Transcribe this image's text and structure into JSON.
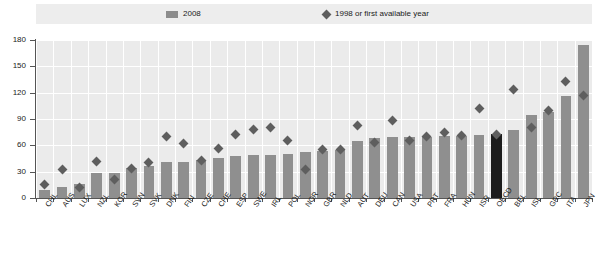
{
  "legend": {
    "items": [
      {
        "label": "2008",
        "marker": "bar-swatch-icon",
        "color": "#8c8c8c"
      },
      {
        "label": "1998 or first available year",
        "marker": "diamond-icon",
        "color": "#5e5e5e"
      }
    ]
  },
  "axis": {
    "y_ticks": [
      "0",
      "30",
      "60",
      "90",
      "120",
      "150",
      "180"
    ]
  },
  "chart_data": {
    "type": "bar",
    "title": "",
    "xlabel": "",
    "ylabel": "",
    "ylim": [
      0,
      180
    ],
    "grid": true,
    "legend_position": "top",
    "highlight_category": "OECD",
    "highlight_color": "#1c1c1c",
    "bar_color": "#8f8f8f",
    "marker_color": "#5e5e5e",
    "categories": [
      "CHL",
      "AUS",
      "LUX",
      "NZL",
      "KOR",
      "SVN",
      "SVK",
      "DNK",
      "FIN",
      "CZE",
      "CHE",
      "ESP",
      "SWE",
      "IRL",
      "POL",
      "NOR",
      "GBR",
      "NLD",
      "AUT",
      "DEU",
      "CAN",
      "USA",
      "PRT",
      "FRA",
      "HUN",
      "ISR",
      "OECD",
      "BEL",
      "ISL",
      "GRC",
      "ITA",
      "JPN"
    ],
    "series": [
      {
        "name": "2008",
        "type": "bar",
        "values": [
          9,
          13,
          16,
          28,
          29,
          34,
          37,
          41,
          41,
          43,
          46,
          48,
          49,
          49,
          50,
          52,
          53,
          55,
          65,
          68,
          69,
          70,
          70,
          71,
          71,
          72,
          73,
          77,
          95,
          98,
          116,
          174
        ]
      },
      {
        "name": "1998 or first available year",
        "type": "scatter",
        "values": [
          15,
          33,
          12,
          42,
          21,
          34,
          41,
          70,
          62,
          43,
          56,
          72,
          78,
          80,
          65,
          32,
          55,
          55,
          83,
          63,
          88,
          65,
          70,
          75,
          71,
          102,
          72,
          124,
          80,
          100,
          133,
          117
        ]
      }
    ]
  }
}
